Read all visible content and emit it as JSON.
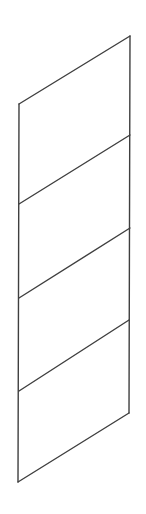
{
  "diagram": {
    "type": "stacked-parallelogram-panels",
    "stroke_color": "#3f3f3f",
    "background": "#ffffff",
    "stroke_width": 1.4,
    "left_edge": {
      "x1": 19,
      "y1": 104,
      "x2": 18,
      "y2": 482
    },
    "right_edge": {
      "x1": 130,
      "y1": 36,
      "x2": 129,
      "y2": 413
    },
    "dividers": [
      {
        "x1": 19,
        "y1": 104,
        "x2": 130,
        "y2": 36
      },
      {
        "x1": 19,
        "y1": 204,
        "x2": 130,
        "y2": 135
      },
      {
        "x1": 19,
        "y1": 298,
        "x2": 130,
        "y2": 228
      },
      {
        "x1": 19,
        "y1": 391,
        "x2": 129,
        "y2": 320
      },
      {
        "x1": 18,
        "y1": 482,
        "x2": 129,
        "y2": 413
      }
    ],
    "panel_count": 4
  }
}
